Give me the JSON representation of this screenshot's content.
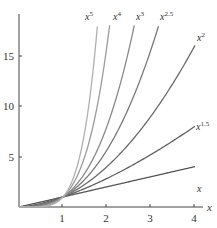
{
  "chart_data": {
    "type": "line",
    "title": "",
    "xlabel": "x",
    "ylabel": "",
    "xlim": [
      0,
      4.2
    ],
    "ylim": [
      0,
      18
    ],
    "grid": false,
    "legend": "inline labels at curve ends",
    "x_ticks": [
      1,
      2,
      3,
      4
    ],
    "y_ticks": [
      5,
      10,
      15
    ],
    "series": [
      {
        "name": "x",
        "exponent": 1,
        "label_base": "x",
        "label_exp": "",
        "color": "#555555",
        "x_end": 4,
        "y_end": 4
      },
      {
        "name": "x^1.5",
        "exponent": 1.5,
        "label_base": "x",
        "label_exp": "1.5",
        "color": "#606060",
        "x_end": 4,
        "y_end": 8
      },
      {
        "name": "x^2",
        "exponent": 2,
        "label_base": "x",
        "label_exp": "2",
        "color": "#6a6a6a",
        "x_end": 4,
        "y_end": 16
      },
      {
        "name": "x^2.5",
        "exponent": 2.5,
        "label_base": "x",
        "label_exp": "2.5",
        "color": "#7a7a7a",
        "x_end": 3.17,
        "y_end": 18
      },
      {
        "name": "x^3",
        "exponent": 3,
        "label_base": "x",
        "label_exp": "3",
        "color": "#8a8a8a",
        "x_end": 2.62,
        "y_end": 18
      },
      {
        "name": "x^4",
        "exponent": 4,
        "label_base": "x",
        "label_exp": "4",
        "color": "#9c9c9c",
        "x_end": 2.06,
        "y_end": 18
      },
      {
        "name": "x^5",
        "exponent": 5,
        "label_base": "x",
        "label_exp": "5",
        "color": "#b0b0b0",
        "x_end": 1.78,
        "y_end": 18
      }
    ]
  },
  "axes": {
    "x_label": "x",
    "x_tick_labels": [
      "1",
      "2",
      "3",
      "4"
    ],
    "y_tick_labels": [
      "5",
      "10",
      "15"
    ]
  },
  "labels": {
    "x": {
      "base": "x",
      "exp": ""
    },
    "x15": {
      "base": "x",
      "exp": "1.5"
    },
    "x2": {
      "base": "x",
      "exp": "2"
    },
    "x25": {
      "base": "x",
      "exp": "2.5"
    },
    "x3": {
      "base": "x",
      "exp": "3"
    },
    "x4": {
      "base": "x",
      "exp": "4"
    },
    "x5": {
      "base": "x",
      "exp": "5"
    }
  }
}
